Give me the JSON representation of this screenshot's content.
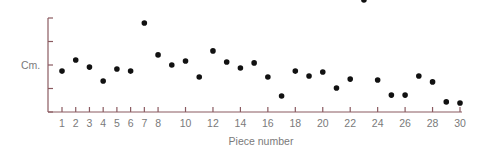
{
  "chart_data": {
    "type": "scatter",
    "title": "",
    "xlabel": "Piece number",
    "ylabel": "Cm.",
    "x_tick_labels": [
      "1",
      "2",
      "3",
      "4",
      "5",
      "6",
      "7",
      "8",
      "10",
      "12",
      "14",
      "16",
      "18",
      "20",
      "22",
      "24",
      "26",
      "28",
      "30"
    ],
    "x_tick_positions": [
      1,
      2,
      3,
      4,
      5,
      6,
      7,
      8,
      10,
      12,
      14,
      16,
      18,
      20,
      22,
      24,
      26,
      28,
      30
    ],
    "y_tick_labels": [],
    "y_ticks": [
      0,
      1,
      2,
      3,
      4
    ],
    "xlim": [
      0,
      30
    ],
    "ylim": [
      0,
      4
    ],
    "grid": false,
    "legend": null,
    "x": [
      1,
      2,
      3,
      4,
      5,
      6,
      7,
      8,
      9,
      10,
      11,
      12,
      13,
      14,
      15,
      16,
      17,
      18,
      19,
      20,
      21,
      22,
      23,
      24,
      25,
      26,
      27,
      28,
      29,
      30
    ],
    "values": [
      1.74,
      2.21,
      1.91,
      1.32,
      1.83,
      1.74,
      3.79,
      2.43,
      2.0,
      2.17,
      1.49,
      2.6,
      2.13,
      1.87,
      2.09,
      1.49,
      0.68,
      1.74,
      1.53,
      1.7,
      1.02,
      1.4,
      4.77,
      1.36,
      0.72,
      0.72,
      1.53,
      1.28,
      0.43,
      0.38
    ],
    "annotations": [
      "Point 23 lies above the plotted area and is clipped at the top edge"
    ]
  },
  "colors": {
    "axis": "#8a5a60",
    "points": "#111111",
    "text": "#7a7a7a",
    "background": "#ffffff"
  }
}
